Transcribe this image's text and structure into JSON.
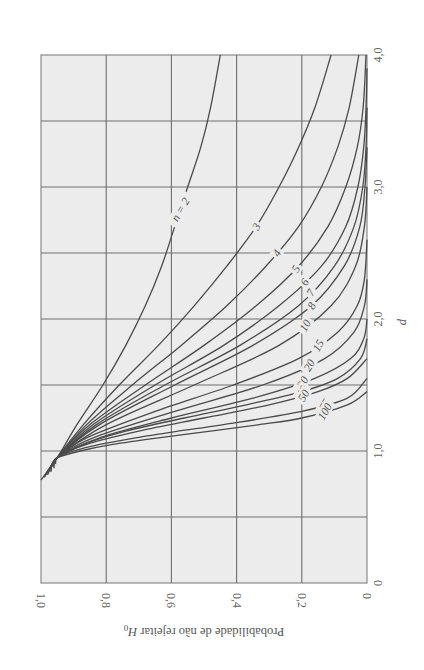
{
  "chart_data": {
    "type": "line",
    "title": "",
    "orientation": "rotated 90 degrees clockwise",
    "xlabel": "d",
    "ylabel": "Probabilidade de não rejeitar H0",
    "ylabel_main": "Probabilidade de não rejeitar ",
    "ylabel_symbol": "H",
    "ylabel_subscript": "0",
    "xlim": [
      0,
      4.0
    ],
    "ylim": [
      0,
      1.0
    ],
    "x_ticks": [
      {
        "value": 0,
        "label": "0"
      },
      {
        "value": 1.0,
        "label": "1,0"
      },
      {
        "value": 2.0,
        "label": "2,0"
      },
      {
        "value": 3.0,
        "label": "3,0"
      },
      {
        "value": 4.0,
        "label": "4,0"
      }
    ],
    "y_ticks": [
      {
        "value": 0,
        "label": "0"
      },
      {
        "value": 0.2,
        "label": "0,2"
      },
      {
        "value": 0.4,
        "label": "0,4"
      },
      {
        "value": 0.6,
        "label": "0,6"
      },
      {
        "value": 0.8,
        "label": "0,8"
      },
      {
        "value": 1.0,
        "label": "1,0"
      }
    ],
    "x_grid_step": 0.5,
    "y_grid_step": 0.2,
    "grid": true,
    "legend": "inline curve labels",
    "series": [
      {
        "name": "n = 2",
        "label": "n = 2",
        "label_at": 2.83,
        "x": [
          0.78,
          0.95,
          1.2,
          1.5,
          1.8,
          2.1,
          2.4,
          2.7,
          3.0,
          3.3,
          3.6,
          4.0
        ],
        "values": [
          1.0,
          0.95,
          0.89,
          0.81,
          0.74,
          0.68,
          0.63,
          0.59,
          0.55,
          0.51,
          0.48,
          0.45
        ]
      },
      {
        "name": "n = 3",
        "label": "3",
        "label_at": 2.7,
        "x": [
          0.8,
          0.95,
          1.2,
          1.5,
          1.8,
          2.1,
          2.4,
          2.7,
          3.0,
          3.3,
          3.6,
          4.0
        ],
        "values": [
          0.99,
          0.95,
          0.87,
          0.76,
          0.64,
          0.53,
          0.43,
          0.34,
          0.27,
          0.21,
          0.16,
          0.11
        ]
      },
      {
        "name": "n = 4",
        "label": "4",
        "label_at": 2.5,
        "x": [
          0.81,
          0.95,
          1.2,
          1.5,
          1.8,
          2.1,
          2.4,
          2.7,
          3.0,
          3.3,
          3.6,
          4.0
        ],
        "values": [
          0.99,
          0.95,
          0.86,
          0.72,
          0.57,
          0.43,
          0.31,
          0.21,
          0.14,
          0.09,
          0.055,
          0.025
        ]
      },
      {
        "name": "n = 5",
        "label": "5",
        "label_at": 2.38,
        "x": [
          0.82,
          0.95,
          1.2,
          1.5,
          1.8,
          2.1,
          2.4,
          2.7,
          3.0,
          3.3,
          3.6,
          4.0
        ],
        "values": [
          0.98,
          0.95,
          0.85,
          0.68,
          0.5,
          0.34,
          0.21,
          0.12,
          0.065,
          0.03,
          0.012,
          0.003
        ]
      },
      {
        "name": "n = 6",
        "label": "6",
        "label_at": 2.28,
        "x": [
          0.83,
          0.95,
          1.2,
          1.5,
          1.8,
          2.1,
          2.4,
          2.7,
          3.0,
          3.3,
          3.6,
          3.9
        ],
        "values": [
          0.98,
          0.95,
          0.84,
          0.65,
          0.44,
          0.27,
          0.14,
          0.065,
          0.028,
          0.01,
          0.003,
          0.0
        ]
      },
      {
        "name": "n = 7",
        "label": "7",
        "label_at": 2.2,
        "x": [
          0.83,
          0.95,
          1.2,
          1.5,
          1.8,
          2.1,
          2.4,
          2.7,
          3.0,
          3.3,
          3.6
        ],
        "values": [
          0.98,
          0.95,
          0.83,
          0.62,
          0.39,
          0.21,
          0.1,
          0.04,
          0.013,
          0.003,
          0.0
        ]
      },
      {
        "name": "n = 8",
        "label": "8",
        "label_at": 2.1,
        "x": [
          0.84,
          0.95,
          1.2,
          1.5,
          1.8,
          2.1,
          2.4,
          2.7,
          3.0,
          3.3
        ],
        "values": [
          0.97,
          0.95,
          0.82,
          0.59,
          0.35,
          0.17,
          0.07,
          0.022,
          0.006,
          0.0
        ]
      },
      {
        "name": "n = 10",
        "label": "10",
        "label_at": 1.95,
        "x": [
          0.85,
          0.95,
          1.2,
          1.5,
          1.8,
          2.1,
          2.4,
          2.7,
          3.0
        ],
        "values": [
          0.97,
          0.95,
          0.8,
          0.53,
          0.27,
          0.11,
          0.035,
          0.008,
          0.0
        ]
      },
      {
        "name": "n = 15",
        "label": "15",
        "label_at": 1.8,
        "x": [
          0.86,
          0.95,
          1.1,
          1.3,
          1.5,
          1.7,
          1.9,
          2.1,
          2.3,
          2.6
        ],
        "values": [
          0.97,
          0.95,
          0.86,
          0.65,
          0.41,
          0.21,
          0.09,
          0.03,
          0.008,
          0.0
        ]
      },
      {
        "name": "n = 20",
        "label": "20",
        "label_at": 1.65,
        "x": [
          0.87,
          0.95,
          1.1,
          1.3,
          1.5,
          1.7,
          1.9,
          2.1,
          2.3
        ],
        "values": [
          0.96,
          0.95,
          0.84,
          0.59,
          0.32,
          0.13,
          0.04,
          0.008,
          0.0
        ]
      },
      {
        "name": "n = 30",
        "label": "30",
        "label_at": 1.52,
        "x": [
          0.88,
          0.95,
          1.1,
          1.25,
          1.4,
          1.55,
          1.7,
          1.85,
          2.0
        ],
        "values": [
          0.96,
          0.95,
          0.82,
          0.6,
          0.35,
          0.16,
          0.05,
          0.01,
          0.0
        ]
      },
      {
        "name": "n = 40",
        "label": "40",
        "label_at": 1.45,
        "x": [
          0.89,
          0.95,
          1.05,
          1.15,
          1.25,
          1.35,
          1.45,
          1.55,
          1.7,
          1.85
        ],
        "values": [
          0.96,
          0.95,
          0.87,
          0.74,
          0.56,
          0.37,
          0.2,
          0.09,
          0.02,
          0.0
        ]
      },
      {
        "name": "n = 50",
        "label": "50",
        "label_at": 1.42,
        "x": [
          0.9,
          0.95,
          1.05,
          1.15,
          1.25,
          1.35,
          1.45,
          1.55,
          1.7
        ],
        "values": [
          0.955,
          0.95,
          0.86,
          0.7,
          0.5,
          0.3,
          0.15,
          0.06,
          0.0
        ]
      },
      {
        "name": "n = 75",
        "label": "75",
        "label_at": 1.35,
        "x": [
          0.91,
          0.95,
          1.0,
          1.05,
          1.1,
          1.15,
          1.2,
          1.3,
          1.4,
          1.55
        ],
        "values": [
          0.955,
          0.95,
          0.9,
          0.82,
          0.71,
          0.58,
          0.44,
          0.2,
          0.06,
          0.0
        ]
      },
      {
        "name": "n = 100",
        "label": "100",
        "label_at": 1.3,
        "x": [
          0.92,
          0.95,
          1.0,
          1.05,
          1.1,
          1.15,
          1.2,
          1.25,
          1.35,
          1.45
        ],
        "values": [
          0.955,
          0.95,
          0.88,
          0.78,
          0.64,
          0.48,
          0.33,
          0.2,
          0.06,
          0.0
        ]
      }
    ]
  }
}
